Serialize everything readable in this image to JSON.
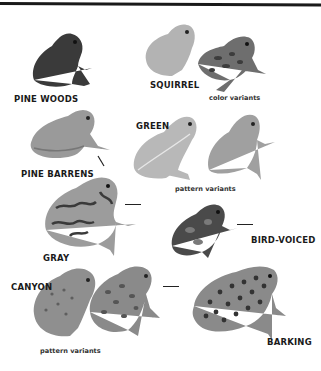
{
  "title_rule": true,
  "species": [
    {
      "id": "pine-woods",
      "label": "PINE WOODS"
    },
    {
      "id": "squirrel",
      "label": "SQUIRREL",
      "note": "color variants"
    },
    {
      "id": "pine-barrens",
      "label": "PINE BARRENS"
    },
    {
      "id": "green",
      "label": "GREEN",
      "note": "pattern variants"
    },
    {
      "id": "gray",
      "label": "GRAY"
    },
    {
      "id": "bird-voiced",
      "label": "BIRD-VOICED"
    },
    {
      "id": "canyon",
      "label": "CANYON",
      "note": "pattern variants"
    },
    {
      "id": "barking",
      "label": "BARKING"
    }
  ],
  "colors": {
    "rule": "#1a1a1a",
    "pine_woods": "#3a3a3a",
    "squirrel_light": "#b3b3b3",
    "squirrel_dark": "#6e6e6e",
    "pine_barrens": "#9a9a9a",
    "green_light": "#b8b8b8",
    "green_dark": "#a0a0a0",
    "gray": "#9c9c9c",
    "bird_voiced": "#4a4a4a",
    "canyon": "#8f8f8f",
    "barking": "#8a8a8a"
  }
}
